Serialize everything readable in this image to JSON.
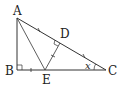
{
  "diagram": {
    "type": "geometry-triangle",
    "points": {
      "A": {
        "label": "A",
        "x": 17,
        "y": 18
      },
      "B": {
        "label": "B",
        "x": 17,
        "y": 70
      },
      "C": {
        "label": "C",
        "x": 106,
        "y": 70
      },
      "D": {
        "label": "D",
        "x": 60,
        "y": 41
      },
      "E": {
        "label": "E",
        "x": 45,
        "y": 70
      }
    },
    "segments": [
      "AB",
      "BC",
      "CA",
      "AE",
      "ED"
    ],
    "right_angles": [
      "B",
      "D"
    ],
    "angle_labels": [
      {
        "vertex": "C",
        "label": "x"
      }
    ],
    "tick_marks": [
      "AD",
      "DC",
      "BE",
      "ED"
    ],
    "colors": {
      "line": "#333333",
      "background": "#ffffff"
    }
  }
}
